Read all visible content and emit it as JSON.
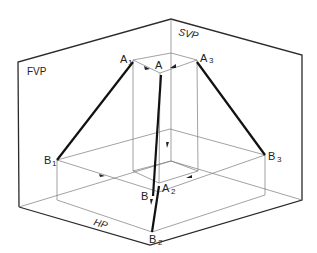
{
  "diagram": {
    "planes": {
      "fvp": "FVP",
      "svp": "SVP",
      "hp": "HP"
    },
    "points": {
      "a": {
        "label": "A",
        "sub": ""
      },
      "a1": {
        "label": "A",
        "sub": "1"
      },
      "a2": {
        "label": "A",
        "sub": "2"
      },
      "a3": {
        "label": "A",
        "sub": "3"
      },
      "b": {
        "label": "B",
        "sub": ""
      },
      "b1": {
        "label": "B",
        "sub": "1"
      },
      "b2": {
        "label": "B",
        "sub": "2"
      },
      "b3": {
        "label": "B",
        "sub": "3"
      }
    },
    "colors": {
      "line": "#111111",
      "construction": "#7a7a7a",
      "background": "#ffffff"
    }
  }
}
